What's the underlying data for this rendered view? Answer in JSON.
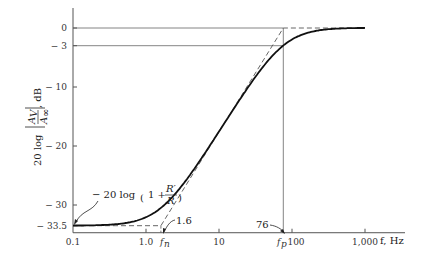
{
  "chart_data": {
    "type": "line",
    "title": "",
    "xscale": "log",
    "xlabel": "f, Hz",
    "ylabel": "20 log |A_V / A_∞|, dB",
    "ylabel_parts": {
      "prefix": "20 log",
      "num": "A",
      "num_sub": "V",
      "den": "A",
      "den_sub": "∞",
      "suffix": ", dB"
    },
    "xlim": [
      0.1,
      1500
    ],
    "ylim": [
      -34.7,
      2.5
    ],
    "x_ticks": [
      {
        "value": 0.1,
        "label": "0.1"
      },
      {
        "value": 1,
        "label": "1.0"
      },
      {
        "value": 10,
        "label": "10"
      },
      {
        "value": 100,
        "label": "100"
      },
      {
        "value": 1000,
        "label": "1,000"
      }
    ],
    "y_ticks": [
      {
        "value": 0,
        "label": "0"
      },
      {
        "value": -3,
        "label": "− 3"
      },
      {
        "value": -10,
        "label": "− 10"
      },
      {
        "value": -20,
        "label": "− 20"
      },
      {
        "value": -30,
        "label": "− 30"
      },
      {
        "value": -33.5,
        "label": "− 33.5"
      }
    ],
    "parameters": {
      "f_n": 1.6,
      "f_p": 76,
      "low_freq_gain_db": -33.5
    },
    "series": [
      {
        "name": "actual response",
        "style": "solid",
        "x": [
          0.1,
          0.2,
          0.5,
          1.0,
          1.6,
          3,
          5,
          10,
          20,
          40,
          76,
          150,
          300,
          600,
          1000
        ],
        "y": [
          -33.5,
          -33.4,
          -32.6,
          -31.0,
          -30.5,
          -28.0,
          -23.5,
          -17.6,
          -11.5,
          -5.8,
          -3.0,
          -1.0,
          -0.3,
          -0.1,
          0.0
        ]
      },
      {
        "name": "asymptotic approximation",
        "style": "dashed",
        "x": [
          0.1,
          1.6,
          76,
          1000
        ],
        "y": [
          -33.5,
          -33.5,
          0,
          0
        ]
      }
    ],
    "annotations": [
      {
        "text": "− 20 log",
        "formula": "(1 + R′/R)",
        "frac_num": "R′",
        "frac_den": "R",
        "points_to": {
          "x": 0.1,
          "y": -33.5
        }
      },
      {
        "text": "1.6",
        "points_to": {
          "x": 1.6,
          "y": -34.7
        }
      },
      {
        "text": "76",
        "points_to": {
          "x": 76,
          "y": -34.7
        }
      },
      {
        "text": "f_n",
        "main": "f",
        "sub": "n",
        "at_x": 1.6
      },
      {
        "text": "f_p",
        "main": "f",
        "sub": "p",
        "at_x": 76
      }
    ],
    "reference_lines": [
      {
        "orientation": "horizontal",
        "y": 0,
        "to_x": 76
      },
      {
        "orientation": "horizontal",
        "y": -3,
        "to_x": 76
      },
      {
        "orientation": "vertical",
        "x": 76
      }
    ],
    "grid": false,
    "legend": "none"
  }
}
